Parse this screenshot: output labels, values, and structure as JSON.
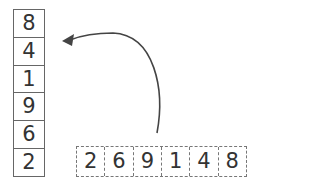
{
  "stack": {
    "values": [
      "8",
      "4",
      "1",
      "9",
      "6",
      "2"
    ]
  },
  "row": {
    "values": [
      "2",
      "6",
      "9",
      "1",
      "4",
      "8"
    ]
  },
  "arrow": {
    "direction": "from row to top of stack",
    "color": "#444444"
  }
}
